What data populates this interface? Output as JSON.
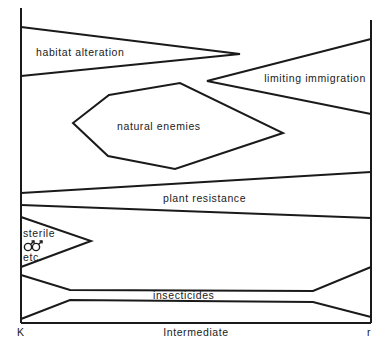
{
  "diagram": {
    "axis": {
      "left_label": "K",
      "center_label": "Intermediate",
      "right_label": "r"
    },
    "tactics": [
      {
        "name": "habitat alteration",
        "shape": "wedge",
        "emphasis": "K"
      },
      {
        "name": "limiting immigration",
        "shape": "wedge",
        "emphasis": "r"
      },
      {
        "name": "natural enemies",
        "shape": "hexagon",
        "emphasis": "Intermediate"
      },
      {
        "name": "plant resistance",
        "shape": "band",
        "emphasis": "all"
      },
      {
        "name": "sterile",
        "symbol": "⚣",
        "suffix": "etc.",
        "shape": "wedge",
        "emphasis": "K"
      },
      {
        "name": "insecticides",
        "shape": "hourglass-band",
        "emphasis": "K and r"
      }
    ]
  }
}
